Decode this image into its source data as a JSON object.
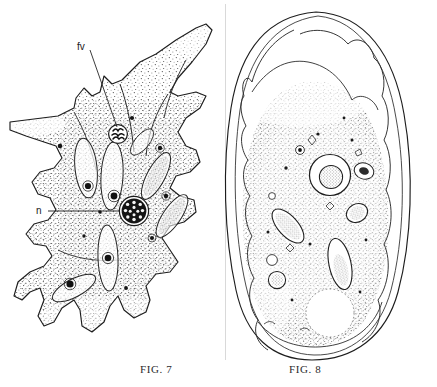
{
  "plate": {
    "title": "Two figures of an amoeba (line drawings)",
    "background_color": "#ffffff",
    "ink_color": "#1a1a1a",
    "stipple_color": "#333333"
  },
  "figures": [
    {
      "id": "fig7",
      "caption_prefix": "F",
      "caption_small": "IG.",
      "caption_number": "7",
      "caption_text": "FIG. 7",
      "subject": "active amoeba with pseudopodia",
      "labels": [
        {
          "key": "fv",
          "text": "fv",
          "meaning": "food-vacuole",
          "label_x": 83,
          "label_y": 47,
          "target_x": 118,
          "target_y": 134
        },
        {
          "key": "n",
          "text": "n",
          "meaning": "nucleus",
          "label_x": 41,
          "label_y": 211,
          "target_x": 134,
          "target_y": 211
        }
      ]
    },
    {
      "id": "fig8",
      "caption_prefix": "F",
      "caption_small": "IG.",
      "caption_number": "8",
      "caption_text": "FIG. 8",
      "subject": "rounded amoeba with ectoplasm and contractile vacuole",
      "labels": []
    }
  ],
  "caption_row": {
    "fig7_label": "FIG. 7",
    "fig8_label": "FIG. 8"
  }
}
